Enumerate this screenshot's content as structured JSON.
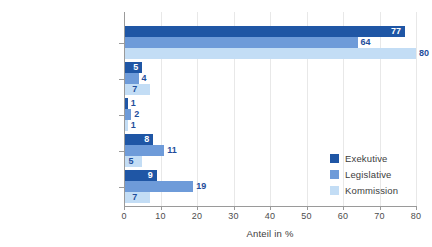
{
  "chart_data": {
    "type": "bar",
    "orientation": "horizontal",
    "title": "",
    "xlabel": "Anteil in %",
    "ylabel": "",
    "xlim": [
      0,
      80
    ],
    "xticks": [
      0,
      10,
      20,
      30,
      40,
      50,
      60,
      70,
      80
    ],
    "xtick_labels": [
      "0",
      "10",
      "20",
      "30",
      "40",
      "50",
      "60",
      "70",
      "80"
    ],
    "grid": "vertical",
    "legend_position": "center-right",
    "categories": [
      "Verheiratet",
      "In einer Partnerschaft",
      "Verwitwet",
      "Geschieden",
      "Ledig"
    ],
    "series": [
      {
        "name": "Exekutive",
        "color": "#1f56a5",
        "values": [
          77,
          5,
          1,
          8,
          9
        ],
        "labels": [
          "77",
          "5",
          "1",
          "8",
          "9"
        ]
      },
      {
        "name": "Legislative",
        "color": "#6e9bd9",
        "values": [
          64,
          4,
          2,
          11,
          19
        ],
        "labels": [
          "64",
          "4",
          "2",
          "11",
          "19"
        ]
      },
      {
        "name": "Kommission",
        "color": "#c3ddf5",
        "values": [
          80,
          7,
          1,
          5,
          7
        ],
        "labels": [
          "80",
          "7",
          "1",
          "5",
          "7"
        ]
      }
    ],
    "colors": {
      "exekutive": "#1f56a5",
      "legislative": "#6e9bd9",
      "kommission": "#c3ddf5",
      "label_inside": "#ffffff",
      "label_outside": "#1f4e9c",
      "gridline": "#e8e8e8",
      "axis": "#9a9a9a",
      "text": "#3d3d3d",
      "background": "#ffffff"
    }
  },
  "legend": {
    "items": [
      {
        "label": "Exekutive",
        "color": "#1f56a5"
      },
      {
        "label": "Legislative",
        "color": "#6e9bd9"
      },
      {
        "label": "Kommission",
        "color": "#c3ddf5"
      }
    ]
  }
}
